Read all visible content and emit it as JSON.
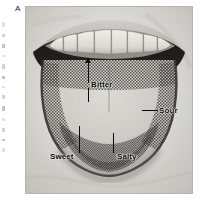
{
  "figure": {
    "panel_letter": "A",
    "background_color": "#ffffff",
    "photo": {
      "subject": "open-mouth-tongue-photograph",
      "tone_light": "#dedcd8",
      "tone_mid": "#a9a6a1",
      "tone_dark": "#1d1b19",
      "border_color": "#b7b4af"
    }
  },
  "annotations": [
    {
      "id": "bitter",
      "label": "Bitter",
      "region": "posterior-tongue",
      "leader_type": "arrow-up",
      "x": 91,
      "y": 80
    },
    {
      "id": "sour",
      "label": "Sour",
      "region": "lateral-posterior-tongue",
      "leader_type": "horizontal-line",
      "x": 159,
      "y": 106
    },
    {
      "id": "sweet",
      "label": "Sweet",
      "region": "anterior-tongue-tip",
      "leader_type": "vertical-line",
      "x": 50,
      "y": 152
    },
    {
      "id": "salty",
      "label": "Salty",
      "region": "anterior-lateral-tongue",
      "leader_type": "vertical-line",
      "x": 117,
      "y": 152
    }
  ],
  "stipple": {
    "description": "checkered-halftone-overlay-marking-taste-zones",
    "dot_color": "#2a2826",
    "coarse_spacing_px": 3,
    "fine_spacing_px": 2
  },
  "edge_column": {
    "description": "clipped-illegible-text-fragments-from-adjacent-column",
    "fragment_count": 13,
    "color": "#585858"
  },
  "text_color": "#0b0b0b",
  "label_halo_color": "#e8e6e2"
}
